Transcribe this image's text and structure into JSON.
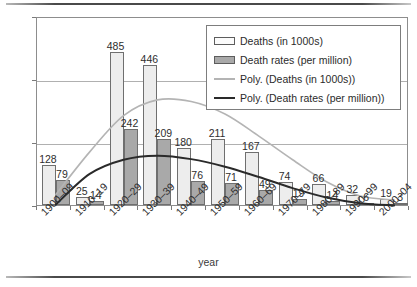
{
  "chart_data": {
    "type": "bar",
    "title": "",
    "xlabel": "year",
    "ylabel": "",
    "ylim": [
      0,
      600
    ],
    "yticks": [
      "0",
      "200",
      "400",
      "600"
    ],
    "grid": true,
    "legend_position": "top-right",
    "categories": [
      "1900–09",
      "1910–19",
      "1920–29",
      "1930–39",
      "1940–49",
      "1950–59",
      "1960–69",
      "1970–79",
      "1980–89",
      "1990–99",
      "2000–04"
    ],
    "series": [
      {
        "name": "Deaths (in 1000s)",
        "type": "bar",
        "color": "#ededed",
        "values": [
          128,
          25,
          485,
          446,
          180,
          211,
          167,
          74,
          66,
          32,
          19
        ]
      },
      {
        "name": "Death rates (per million)",
        "type": "bar",
        "color": "#a9a9a9",
        "values": [
          79,
          14,
          242,
          209,
          76,
          71,
          49,
          19,
          14,
          6,
          3
        ]
      },
      {
        "name": "Poly. (Deaths (in 1000s))",
        "type": "line",
        "color": "#b4b4b4",
        "values": [
          40,
          175,
          290,
          340,
          335,
          295,
          225,
          150,
          80,
          35,
          22
        ]
      },
      {
        "name": "Poly. (Death rates (per million))",
        "type": "line",
        "color": "#2a2a2a",
        "values": [
          8,
          105,
          150,
          163,
          152,
          128,
          95,
          60,
          30,
          12,
          5
        ]
      }
    ]
  },
  "axes": {
    "y_tick_labels": [
      "600",
      "400",
      "200",
      "0"
    ],
    "x_title": "year"
  },
  "legend": {
    "entries": [
      {
        "label": "Deaths (in 1000s)",
        "swatch": "box-light"
      },
      {
        "label": "Death rates (per million)",
        "swatch": "box-dark"
      },
      {
        "label": "Poly. (Deaths (in 1000s))",
        "swatch": "line-light"
      },
      {
        "label": "Poly. (Death rates (per million))",
        "swatch": "line-dark"
      }
    ]
  },
  "colors": {
    "deaths_bar": "#ededed",
    "death_rates_bar": "#a9a9a9",
    "deaths_trend": "#b4b4b4",
    "death_rates_trend": "#2a2a2a",
    "frame": "#8d8d8d",
    "grid": "#b0b0b0"
  }
}
